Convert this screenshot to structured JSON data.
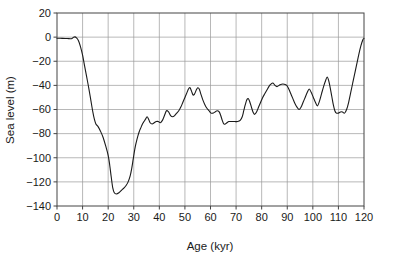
{
  "chart_data": {
    "type": "line",
    "title": "",
    "xlabel": "Age (kyr)",
    "ylabel": "Sea level (m)",
    "xlim": [
      0,
      120
    ],
    "ylim": [
      -140,
      20
    ],
    "xticks": [
      0,
      10,
      20,
      30,
      40,
      50,
      60,
      70,
      80,
      90,
      100,
      110,
      120
    ],
    "yticks": [
      20,
      0,
      -20,
      -40,
      -60,
      -80,
      -100,
      -120,
      -140
    ],
    "xtick_labels": [
      "0",
      "10",
      "20",
      "30",
      "40",
      "50",
      "60",
      "70",
      "80",
      "90",
      "100",
      "110",
      "120"
    ],
    "ytick_labels": [
      "20",
      "0",
      "-20",
      "-40",
      "-60",
      "-80",
      "-100",
      "-120",
      "-140"
    ],
    "grid": true,
    "grid_color": "#9a9a9a",
    "line_color": "#1a1a1a",
    "line_width": 1.1,
    "legend": null,
    "series": [
      {
        "name": "Sea level",
        "x": [
          0,
          1,
          2,
          3,
          4,
          5,
          6,
          6.5,
          7,
          7.5,
          8,
          9,
          10,
          11,
          12,
          13,
          14,
          15,
          16,
          17,
          18,
          19,
          20,
          21,
          22,
          23,
          24,
          25,
          26,
          27,
          28,
          29,
          30,
          31,
          32,
          33,
          34,
          35,
          36,
          37,
          38,
          39,
          40,
          41,
          42,
          43,
          44,
          45,
          46,
          47,
          48,
          49,
          50,
          51,
          52,
          53,
          54,
          55,
          56,
          57,
          58,
          59,
          60,
          61,
          62,
          63,
          64,
          65,
          66,
          67,
          68,
          69,
          70,
          71,
          72,
          73,
          74,
          75,
          76,
          77,
          78,
          79,
          80,
          81,
          82,
          83,
          84,
          85,
          86,
          87,
          88,
          89,
          90,
          91,
          92,
          93,
          94,
          95,
          96,
          97,
          98,
          99,
          100,
          101,
          102,
          103,
          104,
          105,
          106,
          107,
          108,
          109,
          110,
          111,
          112,
          113,
          114,
          115,
          116,
          117,
          118,
          119,
          120
        ],
        "y": [
          -1,
          -1,
          -1,
          -1,
          -1,
          -1,
          -1,
          0,
          0.5,
          0,
          -2,
          -6,
          -13,
          -22,
          -33,
          -46,
          -56,
          -62,
          -66,
          -72,
          -79,
          -87,
          -95,
          -101,
          -108,
          -113,
          -117,
          -120,
          -122,
          -122,
          -121,
          -118,
          -114,
          -110,
          -106,
          -102,
          -97,
          -92,
          -85,
          -79,
          -73,
          -68,
          -64,
          -62,
          -60,
          -58,
          -56,
          -53,
          -50,
          -48,
          -47,
          -46,
          -45,
          -44,
          -43,
          -42,
          -41,
          -40,
          -41,
          -43,
          -45,
          -47,
          -49,
          -52,
          -55,
          -57,
          -58,
          -57,
          -55,
          -52,
          -49,
          -46,
          -44,
          -43,
          -44,
          -46,
          -48,
          -49,
          -48,
          -47,
          -45,
          -43,
          -42,
          -43,
          -45,
          -47,
          -50,
          -53,
          -55,
          -57,
          -59,
          -60,
          -61,
          -62,
          -63,
          -63,
          -63,
          -62,
          -61,
          -59,
          -57,
          -55,
          -52,
          -50,
          -48,
          -47,
          -47,
          -48,
          -49,
          -51,
          -54,
          -57,
          -60,
          -62,
          -62,
          -61,
          -58,
          -53,
          -46,
          -38,
          -28,
          -17,
          -6
        ]
      }
    ],
    "curve": [
      [
        0,
        -1
      ],
      [
        2,
        -1
      ],
      [
        4,
        -1.2
      ],
      [
        5.6,
        -1.3
      ],
      [
        6.4,
        -0.2
      ],
      [
        7.0,
        0.2
      ],
      [
        7.6,
        -0.6
      ],
      [
        8.4,
        -3
      ],
      [
        9.2,
        -8
      ],
      [
        10.0,
        -15
      ],
      [
        10.8,
        -24
      ],
      [
        11.6,
        -33
      ],
      [
        12.4,
        -42
      ],
      [
        13.2,
        -52
      ],
      [
        14.0,
        -62
      ],
      [
        14.6,
        -68
      ],
      [
        15.2,
        -72
      ],
      [
        16.0,
        -74
      ],
      [
        17.0,
        -78
      ],
      [
        18.0,
        -83
      ],
      [
        19.0,
        -90
      ],
      [
        20.0,
        -98
      ],
      [
        20.6,
        -106
      ],
      [
        21.2,
        -116
      ],
      [
        21.8,
        -125
      ],
      [
        22.4,
        -129
      ],
      [
        23.2,
        -130
      ],
      [
        24.2,
        -129
      ],
      [
        25.2,
        -127
      ],
      [
        26.2,
        -125
      ],
      [
        27.0,
        -123
      ],
      [
        27.8,
        -120
      ],
      [
        28.6,
        -115
      ],
      [
        29.2,
        -109
      ],
      [
        29.8,
        -101
      ],
      [
        30.4,
        -93
      ],
      [
        31.0,
        -87
      ],
      [
        31.6,
        -82
      ],
      [
        32.2,
        -78
      ],
      [
        32.8,
        -75
      ],
      [
        33.4,
        -72
      ],
      [
        34.0,
        -70
      ],
      [
        34.6,
        -68
      ],
      [
        35.2,
        -66
      ],
      [
        35.8,
        -68
      ],
      [
        36.4,
        -71
      ],
      [
        37.2,
        -72
      ],
      [
        38.0,
        -71
      ],
      [
        38.8,
        -70
      ],
      [
        39.6,
        -70
      ],
      [
        40.4,
        -71
      ],
      [
        41.2,
        -69
      ],
      [
        42.0,
        -65
      ],
      [
        42.8,
        -61
      ],
      [
        43.6,
        -62
      ],
      [
        44.4,
        -65
      ],
      [
        45.2,
        -66
      ],
      [
        46.0,
        -65
      ],
      [
        46.8,
        -63
      ],
      [
        47.6,
        -61
      ],
      [
        48.4,
        -58
      ],
      [
        49.2,
        -54
      ],
      [
        50.0,
        -50
      ],
      [
        50.8,
        -46
      ],
      [
        51.4,
        -43
      ],
      [
        52.0,
        -42
      ],
      [
        52.6,
        -45
      ],
      [
        53.2,
        -48
      ],
      [
        53.8,
        -47
      ],
      [
        54.4,
        -44
      ],
      [
        55.0,
        -42
      ],
      [
        55.6,
        -43
      ],
      [
        56.2,
        -47
      ],
      [
        57.0,
        -52
      ],
      [
        57.8,
        -56
      ],
      [
        58.6,
        -59
      ],
      [
        59.4,
        -61
      ],
      [
        60.2,
        -63
      ],
      [
        61.0,
        -63
      ],
      [
        61.8,
        -62
      ],
      [
        62.6,
        -61
      ],
      [
        63.4,
        -62
      ],
      [
        64.0,
        -65
      ],
      [
        64.6,
        -69
      ],
      [
        65.2,
        -72
      ],
      [
        65.8,
        -72
      ],
      [
        66.4,
        -71
      ],
      [
        67.2,
        -70
      ],
      [
        68.2,
        -70
      ],
      [
        69.4,
        -70
      ],
      [
        70.6,
        -70
      ],
      [
        71.6,
        -69
      ],
      [
        72.4,
        -66
      ],
      [
        73.0,
        -61
      ],
      [
        73.6,
        -56
      ],
      [
        74.2,
        -52
      ],
      [
        74.8,
        -51
      ],
      [
        75.4,
        -54
      ],
      [
        76.0,
        -58
      ],
      [
        76.6,
        -62
      ],
      [
        77.2,
        -64
      ],
      [
        78.0,
        -62
      ],
      [
        78.8,
        -58
      ],
      [
        79.6,
        -54
      ],
      [
        80.4,
        -50
      ],
      [
        81.2,
        -47
      ],
      [
        82.0,
        -44
      ],
      [
        82.8,
        -41
      ],
      [
        83.6,
        -39
      ],
      [
        84.4,
        -38
      ],
      [
        85.2,
        -40
      ],
      [
        86.0,
        -41
      ],
      [
        86.8,
        -40
      ],
      [
        87.8,
        -39
      ],
      [
        88.8,
        -39
      ],
      [
        89.8,
        -40
      ],
      [
        90.6,
        -43
      ],
      [
        91.4,
        -47
      ],
      [
        92.2,
        -51
      ],
      [
        93.0,
        -55
      ],
      [
        93.8,
        -58
      ],
      [
        94.6,
        -60
      ],
      [
        95.4,
        -58
      ],
      [
        96.2,
        -54
      ],
      [
        97.0,
        -50
      ],
      [
        97.8,
        -46
      ],
      [
        98.6,
        -43
      ],
      [
        99.4,
        -46
      ],
      [
        100.2,
        -50
      ],
      [
        101.0,
        -54
      ],
      [
        101.8,
        -57
      ],
      [
        102.6,
        -53
      ],
      [
        103.4,
        -47
      ],
      [
        104.2,
        -41
      ],
      [
        105.0,
        -36
      ],
      [
        105.6,
        -33
      ],
      [
        106.2,
        -36
      ],
      [
        106.8,
        -42
      ],
      [
        107.4,
        -49
      ],
      [
        108.0,
        -56
      ],
      [
        108.6,
        -61
      ],
      [
        109.2,
        -63
      ],
      [
        110.0,
        -63
      ],
      [
        110.8,
        -62
      ],
      [
        111.6,
        -62
      ],
      [
        112.4,
        -63
      ],
      [
        113.2,
        -60
      ],
      [
        114.0,
        -54
      ],
      [
        114.8,
        -46
      ],
      [
        115.6,
        -38
      ],
      [
        116.4,
        -30
      ],
      [
        117.2,
        -22
      ],
      [
        118.0,
        -14
      ],
      [
        118.8,
        -7
      ],
      [
        119.6,
        -2
      ],
      [
        120,
        -1
      ]
    ]
  },
  "figure": {
    "background": "#ffffff",
    "plot_background": "#ffffff",
    "frame_color": "#444444"
  }
}
